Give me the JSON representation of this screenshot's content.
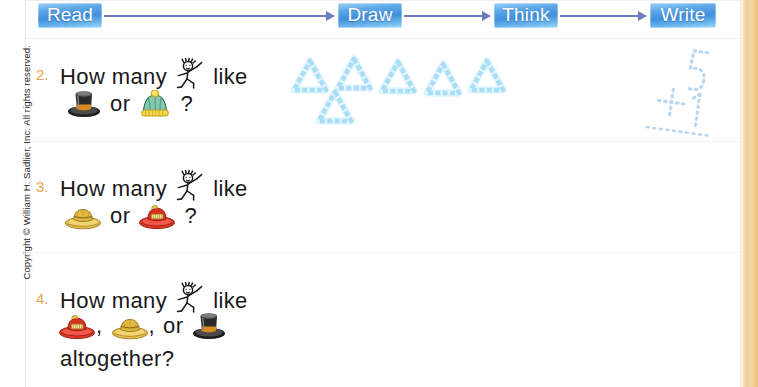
{
  "page": {
    "copyright": "Copyright © William H. Sadlier, Inc. All rights reserved.",
    "accent_orange": "#e8a44c",
    "band_color": "#f3cf93",
    "flow_box_blue": "#5fa9e8",
    "arrow_color": "#6f7bc0",
    "trace_blue": "#8fd4f2",
    "text_color": "#1a1a1a"
  },
  "flow": {
    "steps": [
      {
        "label": "Read",
        "icon": "flow-step-read"
      },
      {
        "label": "Draw",
        "icon": "flow-step-draw"
      },
      {
        "label": "Think",
        "icon": "flow-step-think"
      },
      {
        "label": "Write",
        "icon": "flow-step-write"
      }
    ]
  },
  "problems": [
    {
      "number": "2.",
      "line1_a": "How  many",
      "line1_b": "like",
      "line2_join": "or",
      "line2_end": "?",
      "icons": [
        "stick-figure-icon",
        "top-hat-icon",
        "knit-cap-icon"
      ],
      "answer_line3": ""
    },
    {
      "number": "3.",
      "line1_a": "How  many",
      "line1_b": "like",
      "line2_join": "or",
      "line2_end": "?",
      "icons": [
        "stick-figure-icon",
        "straw-hat-icon",
        "fire-hat-icon"
      ],
      "answer_line3": ""
    },
    {
      "number": "4.",
      "line1_a": "How  many",
      "line1_b": "like",
      "line2_comma1": ",",
      "line2_comma2": ",",
      "line2_join": "or",
      "icons": [
        "stick-figure-icon",
        "fire-hat-icon",
        "straw-hat-icon",
        "top-hat-icon"
      ],
      "answer_line3": "altogether?"
    }
  ],
  "draw_work": {
    "shape": "triangle",
    "color": "#8fd4f2",
    "row1_count": 5,
    "row2_count": 1,
    "total": 6
  },
  "write_work": {
    "top_number": "5",
    "operator": "+",
    "bottom_number": "1",
    "has_sum_rule": true,
    "style": "dotted-trace",
    "color": "#b9d8f0"
  }
}
